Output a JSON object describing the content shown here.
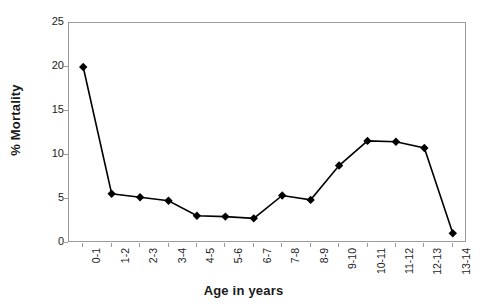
{
  "chart_data": {
    "type": "line",
    "title": "",
    "xlabel": "Age in years",
    "ylabel": "% Mortality",
    "categories": [
      "0-1",
      "1-2",
      "2-3",
      "3-4",
      "4-5",
      "5-6",
      "6-7",
      "7-8",
      "8-9",
      "9-10",
      "10-11",
      "11-12",
      "12-13",
      "13-14"
    ],
    "values": [
      20.0,
      5.6,
      5.2,
      4.8,
      3.1,
      3.0,
      2.8,
      5.4,
      4.9,
      8.8,
      11.6,
      11.5,
      10.8,
      1.1
    ],
    "ylim": [
      0,
      25
    ],
    "yticks": [
      0,
      5,
      10,
      15,
      20,
      25
    ],
    "ytick_labels": [
      "0",
      "5",
      "10",
      "15",
      "20",
      "25"
    ],
    "grid": false,
    "legend": "none",
    "marker": "diamond",
    "line_color": "#000000",
    "marker_color": "#000000",
    "axis_color": "#9a9a9a",
    "background": "#ffffff"
  }
}
